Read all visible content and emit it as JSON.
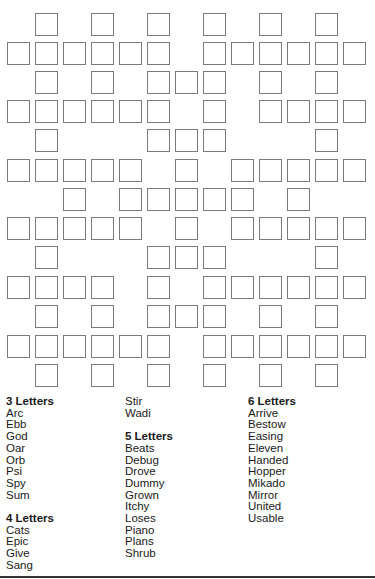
{
  "puzzle": {
    "type": "fill-in crossword",
    "grid": {
      "columns": 13,
      "rows": 13,
      "cell_pitch_x": 28,
      "row_tops": [
        13,
        42,
        71,
        100,
        129,
        159,
        188,
        217,
        246,
        276,
        305,
        335,
        364
      ],
      "left_origin": 7,
      "cells_by_row": [
        [
          1,
          3,
          5,
          7,
          9,
          11
        ],
        [
          0,
          1,
          2,
          3,
          4,
          5,
          7,
          8,
          9,
          10,
          11,
          12
        ],
        [
          1,
          3,
          5,
          6,
          7,
          9,
          11
        ],
        [
          0,
          1,
          2,
          3,
          4,
          5,
          7,
          9,
          10,
          11,
          12
        ],
        [
          1,
          5,
          6,
          7,
          11
        ],
        [
          0,
          1,
          2,
          3,
          4,
          6,
          8,
          9,
          10,
          11,
          12
        ],
        [
          2,
          4,
          5,
          6,
          7,
          8,
          10
        ],
        [
          0,
          1,
          2,
          3,
          4,
          6,
          8,
          9,
          10,
          11,
          12
        ],
        [
          1,
          5,
          6,
          7,
          11
        ],
        [
          0,
          1,
          2,
          3,
          5,
          7,
          8,
          9,
          10,
          11,
          12
        ],
        [
          1,
          3,
          5,
          6,
          7,
          9,
          11
        ],
        [
          0,
          1,
          2,
          3,
          4,
          5,
          7,
          8,
          9,
          10,
          11,
          12
        ],
        [
          1,
          3,
          5,
          7,
          9,
          11
        ]
      ],
      "cell_border_color": "#7a7a7a"
    },
    "word_columns": [
      {
        "left": 6,
        "groups": [
          {
            "heading": "3 Letters",
            "words": [
              "Arc",
              "Ebb",
              "God",
              "Oar",
              "Orb",
              "Psi",
              "Spy",
              "Sum"
            ]
          },
          {
            "heading": "4 Letters",
            "words": [
              "Cats",
              "Epic",
              "Give",
              "Sang"
            ]
          }
        ]
      },
      {
        "left": 125,
        "groups": [
          {
            "heading": "",
            "words": [
              "Stir",
              "Wadi"
            ]
          },
          {
            "heading": "5 Letters",
            "words": [
              "Beats",
              "Debug",
              "Drove",
              "Dummy",
              "Grown",
              "Itchy",
              "Loses",
              "Piano",
              "Plans",
              "Shrub"
            ]
          }
        ]
      },
      {
        "left": 248,
        "groups": [
          {
            "heading": "6 Letters",
            "words": [
              "Arrive",
              "Bestow",
              "Easing",
              "Eleven",
              "Handed",
              "Hopper",
              "Mikado",
              "Mirror",
              "United",
              "Usable"
            ]
          }
        ]
      }
    ]
  }
}
